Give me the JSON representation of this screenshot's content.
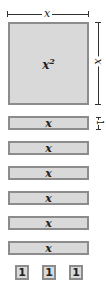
{
  "dimensions": {
    "top_label": "x",
    "right_label": "x",
    "rect_height_label": "1"
  },
  "square_tile": {
    "label_base": "x",
    "label_exp": "2"
  },
  "rect_tiles": [
    {
      "label": "x"
    },
    {
      "label": "x"
    },
    {
      "label": "x"
    },
    {
      "label": "x"
    },
    {
      "label": "x"
    },
    {
      "label": "x"
    }
  ],
  "unit_tiles": [
    {
      "label": "1"
    },
    {
      "label": "1"
    },
    {
      "label": "1"
    }
  ],
  "colors": {
    "tile_fill": "#d9d9d9",
    "tile_border": "#8c8c8c"
  }
}
